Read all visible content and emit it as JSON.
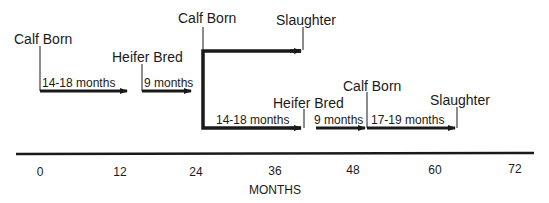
{
  "diagram": {
    "title": "",
    "events": {
      "calf_born_1": "Calf Born",
      "heifer_bred_1": "Heifer Bred",
      "calf_born_2": "Calf Born",
      "slaughter_1": "Slaughter",
      "heifer_bred_2": "Heifer Bred",
      "calf_born_3": "Calf Born",
      "slaughter_2": "Slaughter"
    },
    "durations": {
      "d1": "14-18 months",
      "d2": "9 months",
      "d3": "14-18 months",
      "d4": "9 months",
      "d5": "17-19 months"
    },
    "axis": {
      "ticks": [
        "0",
        "12",
        "24",
        "36",
        "48",
        "60",
        "72"
      ],
      "title": "MONTHS"
    },
    "colors": {
      "ink": "#1a1a1a",
      "background": "#ffffff"
    }
  }
}
